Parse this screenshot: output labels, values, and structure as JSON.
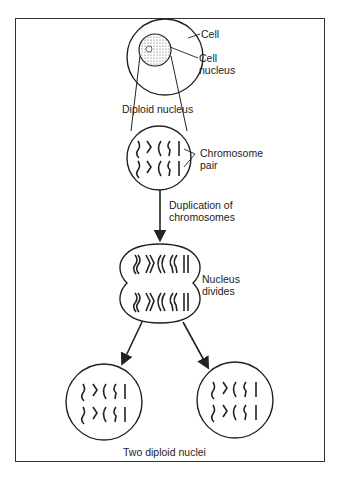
{
  "diagram": {
    "labels": {
      "cell": "Cell",
      "cell_nucleus_line1": "Cell",
      "cell_nucleus_line2": "nucleus",
      "diploid_nucleus": "Diploid nucleus",
      "chromosome_pair_line1": "Chromosome",
      "chromosome_pair_line2": "pair",
      "duplication_line1": "Duplication of",
      "duplication_line2": "chromosomes",
      "nucleus_divides_line1": "Nucleus",
      "nucleus_divides_line2": "divides",
      "two_diploid_nuclei": "Two diploid nuclei"
    },
    "stages": [
      "Cell with nucleus",
      "Diploid nucleus with chromosome pairs",
      "Duplication of chromosomes",
      "Nucleus divides",
      "Two diploid nuclei"
    ],
    "colors": {
      "ink": "#222222",
      "background": "#ffffff"
    }
  }
}
